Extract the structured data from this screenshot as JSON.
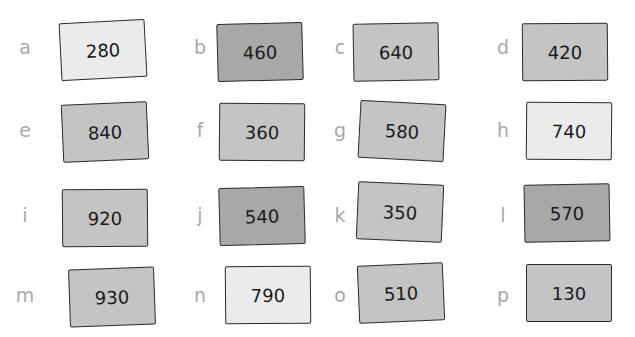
{
  "colors": {
    "light": "#ebebeb",
    "medium": "#c4c4c4",
    "dark": "#a8a8a8",
    "border": "#2a2a2a",
    "letter": "#a8a8a8"
  },
  "cards": [
    {
      "letter": "a",
      "value": "280",
      "shade": "light"
    },
    {
      "letter": "b",
      "value": "460",
      "shade": "dark"
    },
    {
      "letter": "c",
      "value": "640",
      "shade": "medium"
    },
    {
      "letter": "d",
      "value": "420",
      "shade": "medium"
    },
    {
      "letter": "e",
      "value": "840",
      "shade": "medium"
    },
    {
      "letter": "f",
      "value": "360",
      "shade": "medium"
    },
    {
      "letter": "g",
      "value": "580",
      "shade": "medium"
    },
    {
      "letter": "h",
      "value": "740",
      "shade": "light"
    },
    {
      "letter": "i",
      "value": "920",
      "shade": "medium"
    },
    {
      "letter": "j",
      "value": "540",
      "shade": "dark"
    },
    {
      "letter": "k",
      "value": "350",
      "shade": "medium"
    },
    {
      "letter": "l",
      "value": "570",
      "shade": "dark"
    },
    {
      "letter": "m",
      "value": "930",
      "shade": "medium"
    },
    {
      "letter": "n",
      "value": "790",
      "shade": "light"
    },
    {
      "letter": "o",
      "value": "510",
      "shade": "medium"
    },
    {
      "letter": "p",
      "value": "130",
      "shade": "medium"
    }
  ]
}
